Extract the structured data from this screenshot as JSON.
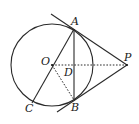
{
  "diagram": {
    "points": {
      "A": "A",
      "B": "B",
      "C": "C",
      "D": "D",
      "O": "O",
      "P": "P"
    },
    "segments": [
      {
        "from": "P",
        "to": "A",
        "style": "solid",
        "kind": "tangent"
      },
      {
        "from": "P",
        "to": "B",
        "style": "solid",
        "kind": "tangent"
      },
      {
        "from": "A",
        "to": "B",
        "style": "solid",
        "kind": "chord"
      },
      {
        "from": "A",
        "to": "C",
        "style": "solid",
        "kind": "diameter"
      },
      {
        "from": "O",
        "to": "P",
        "style": "dashed"
      },
      {
        "from": "O",
        "to": "B",
        "style": "dashed"
      }
    ],
    "circle": {
      "center": "O"
    }
  }
}
